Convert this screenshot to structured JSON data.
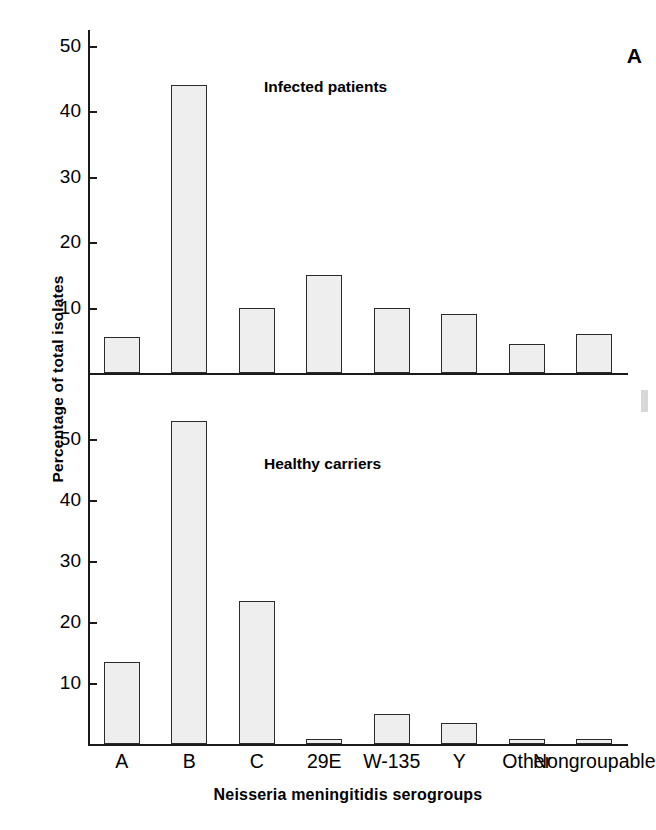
{
  "figure": {
    "panel_letter": "A",
    "xlabel": "Neisseria meningitidis serogroups",
    "ylabel": "Percentage of total isolates"
  },
  "chart_data": {
    "type": "bar",
    "title": "",
    "xlabel": "Neisseria meningitidis serogroups",
    "ylabel": "Percentage of total isolates",
    "grid": false,
    "legend": "in-panel annotations",
    "categories": [
      "A",
      "B",
      "C",
      "29E",
      "W-135",
      "Y",
      "Other",
      "Nongroupable"
    ],
    "panels": [
      {
        "name": "Infected patients",
        "annotation": "Infected patients",
        "ylim": [
          0,
          50
        ],
        "yticks": [
          10,
          20,
          30,
          40,
          50
        ],
        "ytick_labels": [
          "10",
          "20",
          "30",
          "40",
          "50"
        ],
        "values": [
          5.5,
          44,
          10,
          15,
          10,
          9,
          4.5,
          6
        ]
      },
      {
        "name": "Healthy carriers",
        "annotation": "Healthy carriers",
        "ylim": [
          0,
          55
        ],
        "yticks": [
          10,
          20,
          30,
          40,
          50
        ],
        "ytick_labels": [
          "10",
          "20",
          "30",
          "40",
          "50"
        ],
        "values": [
          13.5,
          53,
          23.5,
          0.7,
          5,
          3.5,
          0.8,
          0.6
        ]
      }
    ],
    "colors": {
      "bar_fill": "#eeeeee",
      "bar_edge": "#2b2b2b",
      "axis": "#1a1a1a",
      "text": "#000000",
      "background": "#ffffff"
    }
  }
}
